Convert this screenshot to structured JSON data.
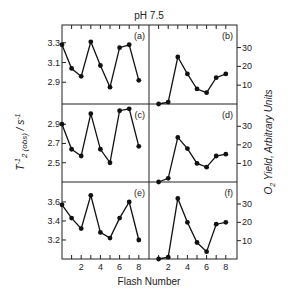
{
  "title": "pH 7.5",
  "xlabel": "Flash Number",
  "ylabel_left": "T2(obs)^-1 / s^-1",
  "ylabel_left_parts": {
    "main": "T",
    "sup": "-1",
    "sub": "2 (obs)",
    "unit": " / s",
    "unit_sup": "-1"
  },
  "ylabel_right": "O2 Yield, Arbitrary Units",
  "ylabel_right_parts": {
    "o": "O",
    "sub": "2",
    "rest": " Yield, Arbitrary Units"
  },
  "colors": {
    "line": "#111111",
    "marker": "#111111",
    "frame": "#222222",
    "background": "#ffffff"
  },
  "chart_data": [
    {
      "panel": "(a)",
      "type": "line",
      "position": "top-left",
      "x": [
        0,
        1,
        2,
        3,
        4,
        5,
        6,
        7,
        8
      ],
      "values": [
        3.28,
        3.04,
        2.96,
        3.31,
        3.07,
        2.85,
        3.25,
        3.28,
        2.92
      ],
      "ylabel": "T2(obs)^-1 / s^-1",
      "yticks": [
        2.9,
        3.1,
        3.3
      ],
      "ylim": [
        2.68,
        3.48
      ],
      "xticks": [],
      "marker": "filled-circle"
    },
    {
      "panel": "(b)",
      "type": "line",
      "position": "top-right",
      "x": [
        1,
        2,
        3,
        4,
        5,
        6,
        7,
        8
      ],
      "values": [
        0,
        1,
        25,
        16,
        8,
        6,
        14,
        16
      ],
      "ylabel": "O2 Yield, Arbitrary Units",
      "yticks": [
        10,
        20,
        30
      ],
      "ylim": [
        0,
        42
      ],
      "xticks": [],
      "marker": "filled-circle"
    },
    {
      "panel": "(c)",
      "type": "line",
      "position": "middle-left",
      "x": [
        0,
        1,
        2,
        3,
        4,
        5,
        6,
        7,
        8
      ],
      "values": [
        2.9,
        2.64,
        2.57,
        3.01,
        2.64,
        2.5,
        3.04,
        3.06,
        2.67
      ],
      "ylabel": "T2(obs)^-1 / s^-1",
      "yticks": [
        2.5,
        2.7,
        2.9
      ],
      "ylim": [
        2.3,
        3.11
      ],
      "xticks": [],
      "marker": "filled-circle"
    },
    {
      "panel": "(d)",
      "type": "line",
      "position": "middle-right",
      "x": [
        1,
        2,
        3,
        4,
        5,
        6,
        7,
        8
      ],
      "values": [
        0,
        2,
        24,
        18,
        10,
        8,
        14,
        15
      ],
      "ylabel": "O2 Yield, Arbitrary Units",
      "yticks": [
        10,
        20,
        30
      ],
      "ylim": [
        0,
        42
      ],
      "xticks": [],
      "marker": "filled-circle"
    },
    {
      "panel": "(e)",
      "type": "line",
      "position": "bottom-left",
      "x": [
        0,
        1,
        2,
        3,
        4,
        5,
        6,
        7,
        8
      ],
      "values": [
        3.57,
        3.43,
        3.32,
        3.67,
        3.28,
        3.22,
        3.43,
        3.6,
        3.2
      ],
      "ylabel": "T2(obs)^-1 / s^-1",
      "yticks": [
        3.2,
        3.4,
        3.6
      ],
      "ylim": [
        3.0,
        3.81
      ],
      "xticks": [
        2,
        4,
        6,
        8
      ],
      "xlabel": "Flash Number",
      "marker": "filled-circle"
    },
    {
      "panel": "(f)",
      "type": "line",
      "position": "bottom-right",
      "x": [
        1,
        2,
        3,
        4,
        5,
        6,
        7,
        8
      ],
      "values": [
        0,
        1,
        33,
        20,
        9,
        4,
        19,
        20
      ],
      "ylabel": "O2 Yield, Arbitrary Units",
      "yticks": [
        10,
        20,
        30
      ],
      "ylim": [
        0,
        42
      ],
      "xticks": [
        2,
        4,
        6,
        8
      ],
      "xlabel": "Flash Number",
      "marker": "filled-circle"
    }
  ],
  "layout": {
    "grid": false,
    "legend": "none",
    "frame": {
      "left": 62,
      "right": 237,
      "top": 25,
      "bottom": 259,
      "divider_x": 149,
      "row_dividers_y": [
        104,
        182
      ]
    },
    "flash_spacing_px": 9.6,
    "flash0_left_x": 63,
    "flash0_right_x": 149
  }
}
